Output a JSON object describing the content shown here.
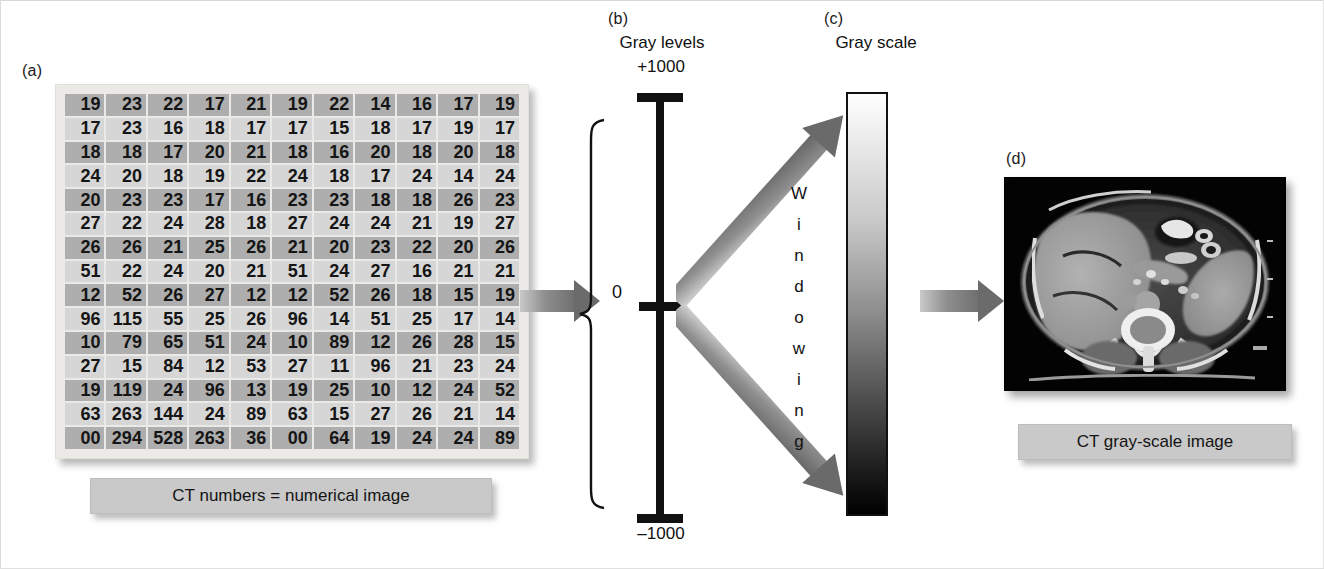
{
  "figure": {
    "panels": {
      "a": {
        "tag": "(a)",
        "caption": "CT numbers = numerical image"
      },
      "b": {
        "tag": "(b)",
        "title": "Gray levels",
        "top_label": "+1000",
        "mid_label": "0",
        "bottom_label": "–1000"
      },
      "c": {
        "tag": "(c)",
        "title": "Gray scale",
        "process_label": "Windowing",
        "process_letters": [
          "W",
          "i",
          "n",
          "d",
          "o",
          "w",
          "i",
          "n",
          "g"
        ]
      },
      "d": {
        "tag": "(d)",
        "caption": "CT gray-scale image",
        "image_alt": "axial abdominal CT slice"
      }
    },
    "colors": {
      "cell_dark": "#aeaeae",
      "cell_light": "#d6d6d6",
      "card_bg": "#eceae6",
      "plaque_bg": "#c9c9c9",
      "arrow_gray": "#6e6e6e",
      "axis_black": "#111111",
      "grayscale_top": "#ffffff",
      "grayscale_bottom": "#000000"
    }
  },
  "chart_data": {
    "type": "table",
    "title": "CT numbers = numerical image",
    "rows": 14,
    "columns": 11,
    "values": [
      [
        "19",
        "23",
        "22",
        "17",
        "21",
        "19",
        "22",
        "14",
        "16",
        "17",
        "19"
      ],
      [
        "17",
        "23",
        "16",
        "18",
        "17",
        "17",
        "15",
        "18",
        "17",
        "19",
        "17"
      ],
      [
        "18",
        "18",
        "17",
        "20",
        "21",
        "18",
        "16",
        "20",
        "18",
        "20",
        "18"
      ],
      [
        "24",
        "20",
        "18",
        "19",
        "22",
        "24",
        "18",
        "17",
        "24",
        "14",
        "24"
      ],
      [
        "20",
        "23",
        "23",
        "17",
        "16",
        "23",
        "23",
        "18",
        "18",
        "26",
        "23"
      ],
      [
        "27",
        "22",
        "24",
        "28",
        "18",
        "27",
        "24",
        "24",
        "21",
        "19",
        "27"
      ],
      [
        "26",
        "26",
        "21",
        "25",
        "26",
        "21",
        "20",
        "23",
        "22",
        "20",
        "26"
      ],
      [
        "51",
        "22",
        "24",
        "20",
        "21",
        "51",
        "24",
        "27",
        "16",
        "21",
        "21"
      ],
      [
        "12",
        "52",
        "26",
        "27",
        "12",
        "12",
        "52",
        "26",
        "18",
        "15",
        "19"
      ],
      [
        "96",
        "115",
        "55",
        "25",
        "26",
        "96",
        "14",
        "51",
        "25",
        "17",
        "14"
      ],
      [
        "10",
        "79",
        "65",
        "51",
        "24",
        "10",
        "89",
        "12",
        "26",
        "28",
        "15"
      ],
      [
        "27",
        "15",
        "84",
        "12",
        "53",
        "27",
        "11",
        "96",
        "21",
        "23",
        "24"
      ],
      [
        "19",
        "119",
        "24",
        "96",
        "13",
        "19",
        "25",
        "10",
        "12",
        "24",
        "52"
      ],
      [
        "63",
        "263",
        "144",
        "24",
        "89",
        "63",
        "15",
        "27",
        "26",
        "21",
        "14"
      ],
      [
        "00",
        "294",
        "528",
        "263",
        "36",
        "00",
        "64",
        "19",
        "24",
        "24",
        "89"
      ]
    ],
    "row_shading": [
      "dark",
      "light",
      "dark",
      "light",
      "dark",
      "light",
      "dark",
      "light",
      "dark",
      "light",
      "dark",
      "light",
      "dark",
      "light",
      "dark"
    ],
    "axis": {
      "name": "Gray levels",
      "ticks": [
        "+1000",
        "0",
        "–1000"
      ],
      "range": [
        -1000,
        1000
      ]
    },
    "grayscale": {
      "name": "Gray scale",
      "top": "white (+1000)",
      "bottom": "black (–1000)",
      "mapping_process": "Windowing"
    }
  }
}
